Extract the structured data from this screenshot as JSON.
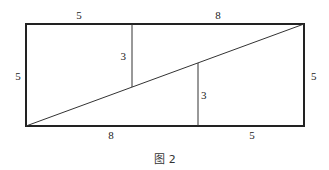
{
  "figure": {
    "caption": "图 2",
    "labels": {
      "top_left": "5",
      "top_right": "8",
      "left_side": "5",
      "right_side": "5",
      "bottom_left": "8",
      "bottom_right": "5",
      "inner_left_segment": "3",
      "inner_right_segment": "3"
    }
  }
}
